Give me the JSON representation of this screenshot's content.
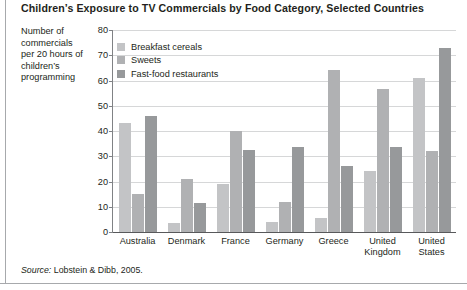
{
  "title": "Children’s Exposure to TV Commercials by Food Category, Selected Countries",
  "y_axis_caption": "Number of commercials per 20 hours of children’s programming",
  "source": {
    "label": "Source:",
    "text": "Lobstein & Dibb, 2005."
  },
  "legend": {
    "position": "inside-top-left",
    "items": [
      {
        "label": "Breakfast cereals",
        "color": "#c3c4c6"
      },
      {
        "label": "Sweets",
        "color": "#b0b1b3"
      },
      {
        "label": "Fast-food restaurants",
        "color": "#97999b"
      }
    ]
  },
  "chart_data": {
    "type": "bar",
    "title": "Children’s Exposure to TV Commercials by Food Category, Selected Countries",
    "xlabel": "",
    "ylabel": "Number of commercials per 20 hours of children’s programming",
    "ylim": [
      0,
      80
    ],
    "yticks": [
      0,
      10,
      20,
      30,
      40,
      50,
      60,
      70,
      80
    ],
    "ytick_labels": [
      "0",
      "10",
      "20",
      "30",
      "40",
      "50",
      "60",
      "70",
      "80"
    ],
    "grid": "horizontal",
    "legend_position": "inside-top-left",
    "categories": [
      "Australia",
      "Denmark",
      "France",
      "Germany",
      "Greece",
      "United Kingdom",
      "United States"
    ],
    "category_label_lines": [
      [
        "Australia"
      ],
      [
        "Denmark"
      ],
      [
        "France"
      ],
      [
        "Germany"
      ],
      [
        "Greece"
      ],
      [
        "United",
        "Kingdom"
      ],
      [
        "United",
        "States"
      ]
    ],
    "series": [
      {
        "name": "Breakfast cereals",
        "color": "#c3c4c6",
        "values": [
          43,
          3.5,
          19,
          4,
          5.5,
          24,
          61
        ]
      },
      {
        "name": "Sweets",
        "color": "#b0b1b3",
        "values": [
          15,
          21,
          40,
          12,
          64,
          56.5,
          32
        ]
      },
      {
        "name": "Fast-food restaurants",
        "color": "#97999b",
        "values": [
          46,
          11.5,
          32.5,
          33.5,
          26,
          33.5,
          73
        ]
      }
    ]
  }
}
